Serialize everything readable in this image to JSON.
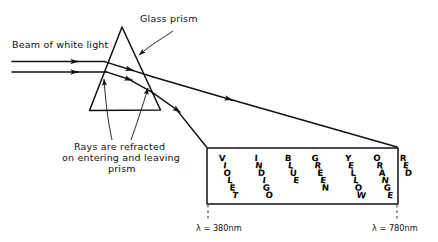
{
  "figure": {
    "title_hidden": "Dispersion of white light through a glass prism",
    "labels": {
      "beam": "Beam of white light",
      "prism": "Glass prism",
      "refraction_line1": "Rays are refracted",
      "refraction_line2": "on entering and leaving",
      "refraction_line3": "prism"
    },
    "wavelengths": {
      "left": "λ = 380nm",
      "right": "λ = 780nm"
    },
    "spectrum": {
      "bands": [
        {
          "name": "VIOLET",
          "letters": [
            "V",
            "I",
            "O",
            "L",
            "E",
            "T"
          ],
          "x": 222
        },
        {
          "name": "INDIGO",
          "letters": [
            "I",
            "N",
            "D",
            "I",
            "G",
            "O"
          ],
          "x": 256
        },
        {
          "name": "BLUE",
          "letters": [
            "B",
            "L",
            "U",
            "E"
          ],
          "x": 288
        },
        {
          "name": "GREEN",
          "letters": [
            "G",
            "R",
            "E",
            "E",
            "N"
          ],
          "x": 315
        },
        {
          "name": "YELLOW",
          "letters": [
            "Y",
            "E",
            "L",
            "L",
            "O",
            "W"
          ],
          "x": 348
        },
        {
          "name": "ORANGE",
          "letters": [
            "O",
            "R",
            "A",
            "N",
            "G",
            "E"
          ],
          "x": 377
        },
        {
          "name": "RED",
          "letters": [
            "R",
            "E",
            "D"
          ],
          "x": 403
        }
      ]
    },
    "colors": {
      "ink": "#111111",
      "paper": "#ffffff"
    },
    "geometry": {
      "prism_apex": "122,27",
      "prism_base_left": "90,110",
      "prism_base_right": "160,110",
      "spectrum_box": "207,148 to 398,204"
    }
  }
}
